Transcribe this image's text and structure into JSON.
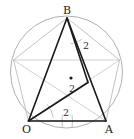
{
  "figure": {
    "type": "geometry-diagram",
    "width": 134,
    "height": 139,
    "background_color": "#ffffff"
  },
  "colors": {
    "circle_stroke": "#9a9a9a",
    "pentagon_stroke": "#a8a8a8",
    "diagonal_stroke": "#bdbdbd",
    "highlight_stroke": "#1a1a1a",
    "arc_stroke": "#9a9a9a",
    "center_dot": "#1a1a1a",
    "label_color": "#1a1a1a",
    "measure_color": "#2b2b2b"
  },
  "circle": {
    "name": "circumscribed-circle",
    "cx": 66.5,
    "cy": 72.0,
    "r": 56.0
  },
  "center_point": {
    "name": "center-dot",
    "cx": 71.0,
    "cy": 78.0,
    "r": 1.6
  },
  "vertices": [
    {
      "id": "B",
      "label": "B",
      "x": 67.0,
      "y": 18.0,
      "label_x": 63.0,
      "label_y": 5.0,
      "labelled": true
    },
    {
      "id": "R1",
      "label": "",
      "x": 119.5,
      "y": 60.0,
      "label_x": 0,
      "label_y": 0,
      "labelled": false
    },
    {
      "id": "A",
      "label": "A",
      "x": 106.0,
      "y": 121.0,
      "label_x": 105.0,
      "label_y": 124.0,
      "labelled": true
    },
    {
      "id": "O",
      "label": "O",
      "x": 28.5,
      "y": 121.0,
      "label_x": 22.0,
      "label_y": 124.0,
      "labelled": true
    },
    {
      "id": "L1",
      "label": "",
      "x": 13.5,
      "y": 60.0,
      "label_x": 0,
      "label_y": 0,
      "labelled": false
    }
  ],
  "inner_vertex": {
    "name": "inner-intersection-point",
    "x": 88.0,
    "y": 82.5
  },
  "pentagon_edges": [
    {
      "from": "B",
      "to": "R1"
    },
    {
      "from": "R1",
      "to": "A"
    },
    {
      "from": "A",
      "to": "O"
    },
    {
      "from": "O",
      "to": "L1"
    },
    {
      "from": "L1",
      "to": "B"
    }
  ],
  "pentagon_diagonals": [
    {
      "from": "B",
      "to": "A"
    },
    {
      "from": "B",
      "to": "O"
    },
    {
      "from": "R1",
      "to": "O"
    },
    {
      "from": "R1",
      "to": "L1"
    },
    {
      "from": "A",
      "to": "L1"
    }
  ],
  "highlight_segments": [
    {
      "name": "segment-OB",
      "from": "O",
      "to": "B"
    },
    {
      "name": "segment-BA",
      "from": "B",
      "to": "A"
    },
    {
      "name": "segment-OA",
      "from": "O",
      "to": "A"
    },
    {
      "name": "segment-O-inner",
      "from": "O",
      "to": "inner"
    },
    {
      "name": "segment-B-inner",
      "from": "B",
      "to": "inner"
    }
  ],
  "measure_arcs": [
    {
      "name": "arc-at-B-right",
      "cx": 67.0,
      "cy": 18.0,
      "r": 26.0,
      "start_deg": 55,
      "end_deg": 82
    },
    {
      "name": "arc-at-O-upper",
      "cx": 28.5,
      "cy": 121.0,
      "r": 25.0,
      "start_deg": 318,
      "end_deg": 352
    },
    {
      "name": "arc-at-O-lower",
      "cx": 28.5,
      "cy": 121.0,
      "r": 44.0,
      "start_deg": 352,
      "end_deg": 8
    },
    {
      "name": "arc-at-A-left",
      "cx": 106.0,
      "cy": 121.0,
      "r": 44.0,
      "start_deg": 172,
      "end_deg": 188
    }
  ],
  "measure_labels": [
    {
      "name": "measure-label-BA",
      "text": "2",
      "x": 83.0,
      "y": 41.0
    },
    {
      "name": "measure-label-inner",
      "text": "2",
      "x": 69.0,
      "y": 84.0
    },
    {
      "name": "measure-label-OA",
      "text": "2",
      "x": 63.0,
      "y": 108.0
    }
  ]
}
